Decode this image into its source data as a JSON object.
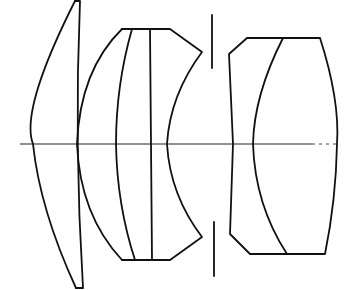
{
  "diagram": {
    "type": "optical-lens-cross-section",
    "colors": {
      "background": "#ffffff",
      "stroke": "#111111"
    },
    "elements": [
      {
        "id": "element-1",
        "kind": "meniscus-lens"
      },
      {
        "id": "element-group-2",
        "kind": "cemented-triplet"
      },
      {
        "id": "aperture-stop",
        "kind": "stop"
      },
      {
        "id": "element-group-3",
        "kind": "cemented-doublet"
      },
      {
        "id": "optical-axis",
        "kind": "axis"
      }
    ]
  }
}
